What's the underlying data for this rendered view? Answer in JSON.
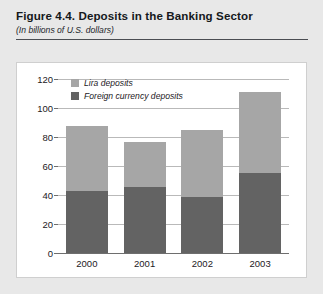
{
  "header": {
    "title": "Figure 4.4.  Deposits in the Banking Sector",
    "subtitle": "(In billions of U.S. dollars)"
  },
  "chart_data": {
    "type": "bar",
    "stacked": true,
    "title": "Figure 4.4.  Deposits in the Banking Sector",
    "subtitle": "(In billions of U.S. dollars)",
    "xlabel": "",
    "ylabel": "",
    "ylim": [
      0,
      120
    ],
    "yticks": [
      0,
      20,
      40,
      60,
      80,
      100,
      120
    ],
    "ytick_labels": [
      "0",
      "20",
      "40",
      "60",
      "80",
      "100",
      "120"
    ],
    "grid": true,
    "legend_position": "top-left-inside",
    "categories": [
      "2000",
      "2001",
      "2002",
      "2003"
    ],
    "series": [
      {
        "name": "Foreign currency deposits",
        "color": "#636363",
        "values": [
          42.7,
          45.5,
          38.6,
          55.0
        ]
      },
      {
        "name": "Lira deposits",
        "color": "#a6a6a6",
        "values": [
          44.9,
          31.0,
          46.4,
          56.0
        ]
      }
    ],
    "totals": [
      87.6,
      76.5,
      85.0,
      111.0
    ]
  },
  "colors": {
    "lira": "#a6a6a6",
    "foreign": "#636363",
    "panel_background": "#ffffff",
    "page_background": "#e8e8e8",
    "gridline": "#b9b9b9",
    "axis": "#6e6e6e",
    "rule": "#4a4d52"
  }
}
